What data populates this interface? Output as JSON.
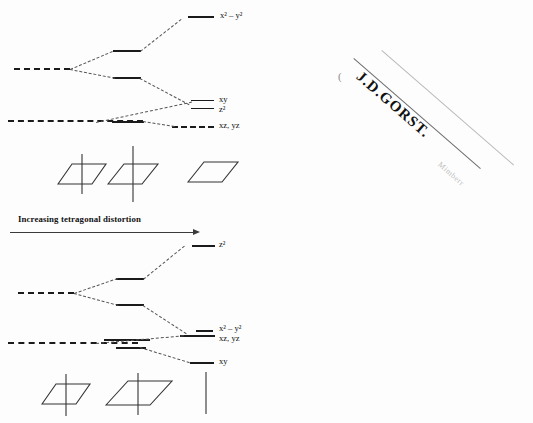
{
  "figure": {
    "kind": "crystal-field-splitting-diagram",
    "axis_label": "Increasing tetragonal distortion",
    "background_color": "#fdfdfd",
    "line_color": "#1b1b1b",
    "tie_line_color": "#555555"
  },
  "top_diagram": {
    "name": "elongated-tetragonal-splitting",
    "labels": {
      "x2y2": "x² – y²",
      "xy": "xy",
      "z2": "z²",
      "xzyz": "xz, yz"
    },
    "levels": [
      {
        "id": "eg-free",
        "label": "",
        "x": 14,
        "y": 68,
        "w": 56,
        "dashed": true
      },
      {
        "id": "t2g-free",
        "label": "",
        "x": 10,
        "y": 120,
        "w": 130,
        "dashed": true
      },
      {
        "id": "eg-upper-mid",
        "label": "",
        "x": 113,
        "y": 51,
        "w": 28
      },
      {
        "id": "eg-lower-mid",
        "label": "",
        "x": 113,
        "y": 78,
        "w": 28
      },
      {
        "id": "t2g-mid",
        "label": "",
        "x": 113,
        "y": 121,
        "w": 46
      },
      {
        "id": "x2y2-final",
        "label": "x² – y²",
        "x": 188,
        "y": 16,
        "w": 26
      },
      {
        "id": "xy-final",
        "label": "xy",
        "x": 192,
        "y": 100,
        "w": 22
      },
      {
        "id": "z2-final",
        "label": "z²",
        "x": 192,
        "y": 108,
        "w": 22
      },
      {
        "id": "xzyz-final",
        "label": "xz, yz",
        "x": 176,
        "y": 126,
        "w": 36,
        "dashed": true
      }
    ]
  },
  "bottom_diagram": {
    "name": "compressed-tetragonal-splitting",
    "labels": {
      "z2": "z²",
      "x2y2": "x² – y²",
      "xzyz": "xz, yz",
      "xy": "xy"
    },
    "levels": [
      {
        "id": "eg-free",
        "label": "",
        "x": 18,
        "y": 292,
        "w": 56,
        "dashed": true
      },
      {
        "id": "t2g-free",
        "label": "",
        "x": 10,
        "y": 342,
        "w": 130,
        "dashed": true
      },
      {
        "id": "eg-upper-mid",
        "label": "",
        "x": 116,
        "y": 278,
        "w": 28
      },
      {
        "id": "eg-lower-mid",
        "label": "",
        "x": 116,
        "y": 304,
        "w": 28
      },
      {
        "id": "t2g-mid-upper",
        "label": "",
        "x": 104,
        "y": 339,
        "w": 46
      },
      {
        "id": "t2g-mid-lower",
        "label": "",
        "x": 116,
        "y": 347,
        "w": 30
      },
      {
        "id": "z2-final",
        "label": "z²",
        "x": 192,
        "y": 245,
        "w": 22
      },
      {
        "id": "x2y2-final",
        "label": "x² – y²",
        "x": 196,
        "y": 330,
        "w": 16
      },
      {
        "id": "xzyz-final",
        "label": "xz, yz",
        "x": 181,
        "y": 335,
        "w": 34
      },
      {
        "id": "xy-final",
        "label": "xy",
        "x": 190,
        "y": 362,
        "w": 22
      }
    ]
  },
  "geometry_row_top": {
    "name": "coordination-geometry-icons-top",
    "icons": [
      {
        "id": "square-planar-elongated",
        "type": "parallelogram-with-axis",
        "axis": "both"
      },
      {
        "id": "tetragonal-elongated",
        "type": "parallelogram-with-long-axis",
        "axis": "both-long"
      },
      {
        "id": "square-planar",
        "type": "parallelogram-only",
        "axis": "none"
      }
    ]
  },
  "geometry_row_bottom": {
    "name": "coordination-geometry-icons-bottom",
    "icons": [
      {
        "id": "compressed-octahedron",
        "type": "parallelogram-with-axis",
        "axis": "both"
      },
      {
        "id": "compressed-octahedron-wide",
        "type": "parallelogram-with-axis-wide",
        "axis": "both"
      },
      {
        "id": "linear",
        "type": "axis-only",
        "axis": "vertical"
      }
    ]
  },
  "stamp": {
    "name": "ownership-stamp",
    "signature": "J.D.GORST.",
    "paren": "(",
    "scrawl": "Mimberr",
    "rotation_deg": 41
  }
}
